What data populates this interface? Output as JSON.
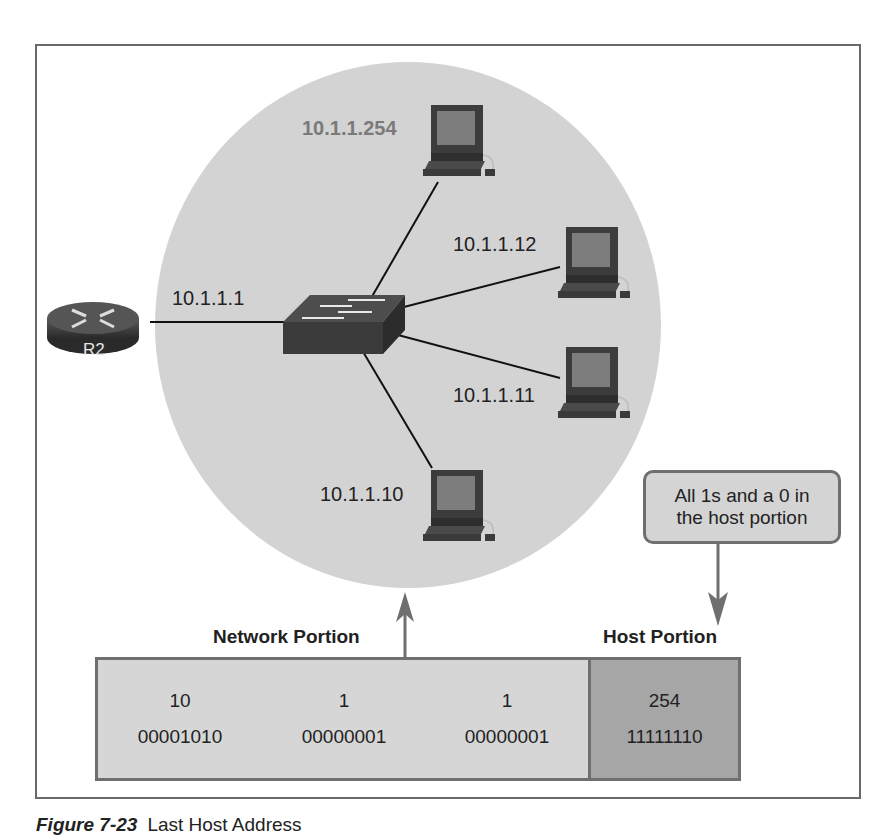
{
  "diagram": {
    "router": {
      "label": "R2",
      "interface_ip": "10.1.1.1"
    },
    "switch": {
      "label": ""
    },
    "hosts": [
      {
        "ip": "10.1.1.254",
        "highlighted": true
      },
      {
        "ip": "10.1.1.12",
        "highlighted": false
      },
      {
        "ip": "10.1.1.11",
        "highlighted": false
      },
      {
        "ip": "10.1.1.10",
        "highlighted": false
      }
    ],
    "callout": {
      "line1": "All 1s and a 0 in",
      "line2": "the host portion"
    },
    "network_portion_label": "Network Portion",
    "host_portion_label": "Host Portion",
    "octets": [
      {
        "decimal": "10",
        "binary": "00001010",
        "portion": "network"
      },
      {
        "decimal": "1",
        "binary": "00000001",
        "portion": "network"
      },
      {
        "decimal": "1",
        "binary": "00000001",
        "portion": "network"
      },
      {
        "decimal": "254",
        "binary": "11111110",
        "portion": "host"
      }
    ]
  },
  "caption": {
    "number": "Figure 7-23",
    "title": "Last Host Address"
  },
  "colors": {
    "lan_circle": "#d3d3d3",
    "network_octets_bg": "#d6d6d6",
    "host_octet_bg": "#a6a6a6",
    "border": "#6f6f6f",
    "highlight_label": "#7a7a7a"
  }
}
